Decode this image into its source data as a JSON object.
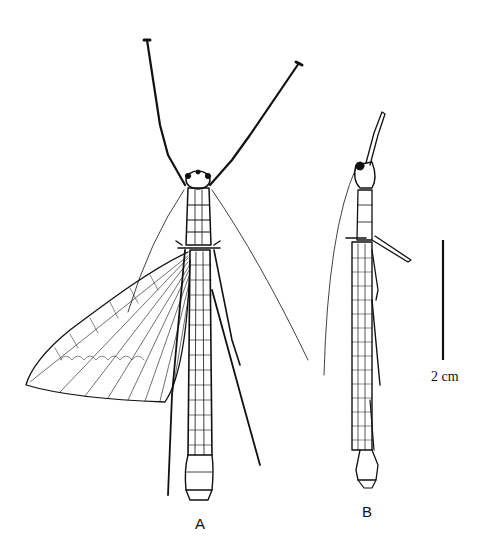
{
  "figure": {
    "panels": [
      {
        "id": "A",
        "label": "A",
        "subject": "insect specimen drawing with spread forewing"
      },
      {
        "id": "B",
        "label": "B",
        "subject": "insect specimen drawing, wings folded"
      }
    ],
    "scale_bar": {
      "label": "2 cm",
      "length_px": 120
    },
    "colors": {
      "ink": "#111111",
      "background": "#ffffff"
    }
  }
}
